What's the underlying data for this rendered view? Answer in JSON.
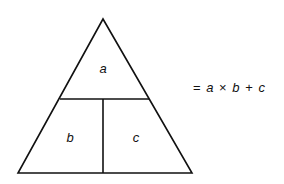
{
  "diagram": {
    "type": "formula-triangle",
    "cells": {
      "top": "a",
      "bottom_left": "b",
      "bottom_right": "c"
    },
    "equation": {
      "equals": "=",
      "a": "a",
      "times": "×",
      "b": "b",
      "plus": "+",
      "c": "c"
    },
    "stroke_color": "#111111"
  }
}
